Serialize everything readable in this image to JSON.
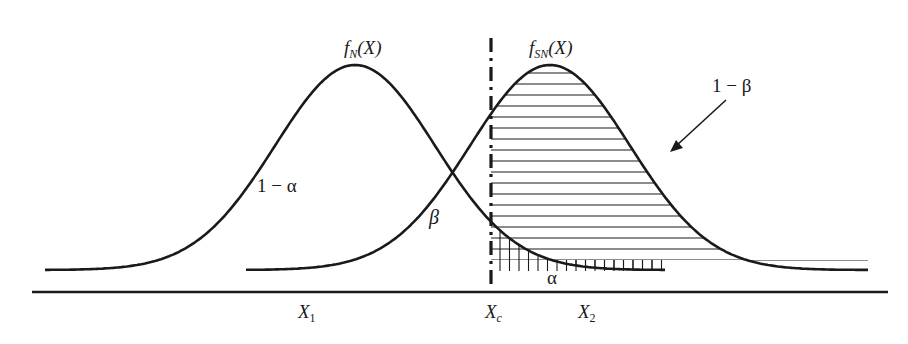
{
  "diagram": {
    "type": "signal-detection-distributions",
    "curves": [
      {
        "name": "noise",
        "label_main": "f",
        "label_sub": "N",
        "label_arg": "(X)",
        "peak_x": 355,
        "peak_y": 65,
        "sigma": 80,
        "start_x": 45,
        "end_x": 666
      },
      {
        "name": "signal-plus-noise",
        "label_main": "f",
        "label_sub": "SN",
        "label_arg": "(X)",
        "peak_x": 550,
        "peak_y": 65,
        "sigma": 80,
        "start_x": 246,
        "end_x": 868
      }
    ],
    "criterion": {
      "x": 491,
      "label_main": "X",
      "label_sub": "c"
    },
    "region_labels": {
      "one_minus_alpha": "1 − α",
      "beta": "β",
      "alpha": "α",
      "one_minus_beta": "1 − β"
    },
    "axis_labels": {
      "x1_main": "X",
      "x1_sub": "1",
      "x2_main": "X",
      "x2_sub": "2"
    },
    "axis": {
      "y": 292,
      "x_start": 32,
      "x_end": 888
    },
    "baseline_y": 260,
    "colors": {
      "stroke": "#1a1a1a",
      "background": "#ffffff"
    }
  }
}
